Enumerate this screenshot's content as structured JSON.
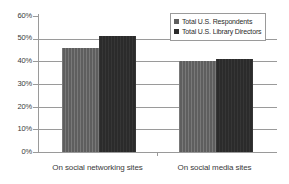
{
  "chart_data": {
    "type": "bar",
    "title": "",
    "subtitle": "",
    "xlabel": "",
    "ylabel": "",
    "categories": [
      "On social networking sites",
      "On social media sites"
    ],
    "series": [
      {
        "name": "Total U.S. Respondents",
        "values": [
          46,
          40
        ],
        "color": "#5e5e5e"
      },
      {
        "name": "Total U.S. Library Directors",
        "values": [
          51,
          41
        ],
        "color": "#2b2b2b"
      }
    ],
    "ylim": [
      0,
      60
    ],
    "ytick_values": [
      0,
      10,
      20,
      30,
      40,
      50,
      60
    ],
    "ytick_labels": [
      "0%",
      "10%",
      "20%",
      "30%",
      "40%",
      "50%",
      "60%"
    ],
    "gridline_values": [
      10,
      20,
      30,
      40,
      50
    ],
    "grid": true,
    "legend_position": "top-right",
    "value_format": "percent"
  },
  "legend": {
    "entries": [
      {
        "label": "Total U.S. Respondents",
        "swatch": "light-gray-swatch"
      },
      {
        "label": "Total U.S. Library Directors",
        "swatch": "dark-swatch"
      }
    ]
  },
  "axis": {
    "y_labels": [
      "60%",
      "50%",
      "40%",
      "30%",
      "20%",
      "10%",
      "0%"
    ],
    "x_labels": [
      "On social networking sites",
      "On social media sites"
    ]
  },
  "colors": {
    "series_1": "#5e5e5e",
    "series_2": "#2b2b2b",
    "axis": "#9a9a9a",
    "grid": "#9a9a9a",
    "text": "#3a3a3a",
    "background": "#ffffff"
  }
}
